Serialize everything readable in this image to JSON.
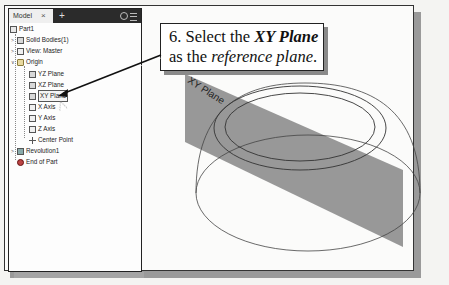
{
  "panel": {
    "tab_label": "Model",
    "close_glyph": "×",
    "add_glyph": "+",
    "icons": [
      "search-icon",
      "menu-icon"
    ]
  },
  "tree": {
    "items": [
      {
        "label": "Part1",
        "icon": "part-icon",
        "level": 0
      },
      {
        "label": "Solid Bodies(1)",
        "icon": "solid-bodies-icon",
        "level": 1,
        "caret": ">"
      },
      {
        "label": "View: Master",
        "icon": "view-icon",
        "level": 1,
        "caret": ">"
      },
      {
        "label": "Origin",
        "icon": "folder-icon",
        "level": 1,
        "caret": "v"
      },
      {
        "label": "YZ Plane",
        "icon": "plane-icon",
        "level": 2
      },
      {
        "label": "XZ Plane",
        "icon": "plane-icon",
        "level": 2
      },
      {
        "label": "XY Plane",
        "icon": "plane-icon",
        "level": 2,
        "selected": true
      },
      {
        "label": "X Axis",
        "icon": "axis-icon",
        "level": 2
      },
      {
        "label": "Y Axis",
        "icon": "axis-icon",
        "level": 2
      },
      {
        "label": "Z Axis",
        "icon": "axis-icon",
        "level": 2
      },
      {
        "label": "Center Point",
        "icon": "center-point-icon",
        "level": 2
      },
      {
        "label": "Revolution1",
        "icon": "revolution-icon",
        "level": 1,
        "caret": ">"
      },
      {
        "label": "End of Part",
        "icon": "end-of-part-icon",
        "level": 1
      }
    ]
  },
  "callout": {
    "step": "6. Select the ",
    "emph": "XY Plane",
    "line2_pre": "as the ",
    "line2_emph": "reference plane",
    "line2_post": "."
  },
  "viewport": {
    "plane_label": "XY Plane",
    "plane_color": "#8f8f8f"
  }
}
